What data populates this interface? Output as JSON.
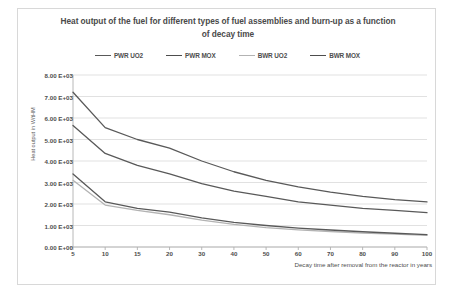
{
  "chart_data": {
    "type": "line",
    "title": "Heat output of the fuel for different types of fuel assemblies and burn-up as a function of decay time",
    "xlabel": "Decay time after removal from the reactor in years",
    "ylabel": "Heat output in W/tHM",
    "categories": [
      "5",
      "10",
      "15",
      "20",
      "30",
      "40",
      "50",
      "60",
      "70",
      "80",
      "90",
      "100"
    ],
    "x": [
      5,
      10,
      15,
      20,
      30,
      40,
      50,
      60,
      70,
      80,
      90,
      100
    ],
    "ylim": [
      0,
      8000
    ],
    "ytick_labels": [
      "0.00 E+00",
      "1.00 E+03",
      "2.00 E+03",
      "3.00 E+03",
      "4.00 E+03",
      "5.00 E+03",
      "6.00 E+03",
      "7.00 E+03",
      "8.00 E+03"
    ],
    "ytick_values": [
      0,
      1000,
      2000,
      3000,
      4000,
      5000,
      6000,
      7000,
      8000
    ],
    "grid": true,
    "legend_position": "top",
    "series": [
      {
        "name": "PWR UO2",
        "color": "#595959",
        "values": [
          7200,
          5550,
          5000,
          4600,
          4000,
          3500,
          3100,
          2800,
          2550,
          2350,
          2200,
          2100
        ]
      },
      {
        "name": "PWR MOX",
        "color": "#595959",
        "values": [
          5650,
          4350,
          3800,
          3400,
          2950,
          2600,
          2350,
          2100,
          1950,
          1800,
          1700,
          1600
        ]
      },
      {
        "name": "BWR UO2",
        "color": "#b3b3b3",
        "values": [
          3100,
          1950,
          1700,
          1500,
          1250,
          1050,
          900,
          800,
          720,
          650,
          600,
          540
        ]
      },
      {
        "name": "BWR MOX",
        "color": "#595959",
        "values": [
          3400,
          2100,
          1800,
          1620,
          1350,
          1150,
          1000,
          880,
          790,
          710,
          640,
          580
        ]
      }
    ]
  }
}
